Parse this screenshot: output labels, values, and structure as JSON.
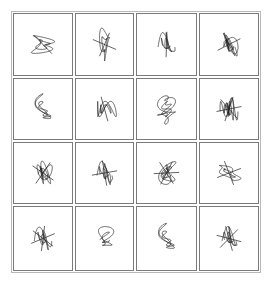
{
  "grid": {
    "rows": 4,
    "cols": 4
  },
  "colors": {
    "line": "#222222",
    "border": "#7a7a7a",
    "background": "#ffffff"
  },
  "figures": [
    {
      "id": "r1c1",
      "row": 1,
      "col": 1,
      "a": 1,
      "b": 2,
      "c": 3,
      "phase": 0.4,
      "orient": "left-shell",
      "spikes": 1
    },
    {
      "id": "r1c2",
      "row": 1,
      "col": 2,
      "a": 2,
      "b": 1,
      "c": 3,
      "phase": 0.0,
      "orient": "up-shell",
      "spikes": 2
    },
    {
      "id": "r1c3",
      "row": 1,
      "col": 3,
      "a": 1,
      "b": 2,
      "c": 4,
      "phase": 1.2,
      "orient": "diamond-wings",
      "spikes": 1
    },
    {
      "id": "r1c4",
      "row": 1,
      "col": 4,
      "a": 2,
      "b": 3,
      "c": 1,
      "phase": 0.7,
      "orient": "triangle-loop",
      "spikes": 2
    },
    {
      "id": "r2c1",
      "row": 2,
      "col": 1,
      "a": 2,
      "b": 1,
      "c": 2,
      "phase": 0.3,
      "orient": "butterfly",
      "spikes": 0
    },
    {
      "id": "r2c2",
      "row": 2,
      "col": 2,
      "a": 1,
      "b": 3,
      "c": 2,
      "phase": 0.9,
      "orient": "barrel",
      "spikes": 1
    },
    {
      "id": "r2c3",
      "row": 2,
      "col": 3,
      "a": 3,
      "b": 2,
      "c": 4,
      "phase": 0.5,
      "orient": "heart-loops",
      "spikes": 0
    },
    {
      "id": "r2c4",
      "row": 2,
      "col": 4,
      "a": 1,
      "b": 4,
      "c": 2,
      "phase": 1.5,
      "orient": "comb",
      "spikes": 3
    },
    {
      "id": "r3c1",
      "row": 3,
      "col": 1,
      "a": 2,
      "b": 3,
      "c": 2,
      "phase": 0.2,
      "orient": "face",
      "spikes": 2
    },
    {
      "id": "r3c2",
      "row": 3,
      "col": 2,
      "a": 1,
      "b": 2,
      "c": 5,
      "phase": 1.0,
      "orient": "eye",
      "spikes": 2
    },
    {
      "id": "r3c3",
      "row": 3,
      "col": 3,
      "a": 3,
      "b": 2,
      "c": 3,
      "phase": 0.6,
      "orient": "star-bug",
      "spikes": 3
    },
    {
      "id": "r3c4",
      "row": 3,
      "col": 4,
      "a": 2,
      "b": 1,
      "c": 4,
      "phase": 0.8,
      "orient": "beetle",
      "spikes": 2
    },
    {
      "id": "r4c1",
      "row": 4,
      "col": 1,
      "a": 1,
      "b": 2,
      "c": 3,
      "phase": 1.3,
      "orient": "cross-star",
      "spikes": 3
    },
    {
      "id": "r4c2",
      "row": 4,
      "col": 2,
      "a": 2,
      "b": 1,
      "c": 2,
      "phase": 0.1,
      "orient": "hood",
      "spikes": 0
    },
    {
      "id": "r4c3",
      "row": 4,
      "col": 3,
      "a": 2,
      "b": 3,
      "c": 2,
      "phase": 0.4,
      "orient": "ovals",
      "spikes": 0
    },
    {
      "id": "r4c4",
      "row": 4,
      "col": 4,
      "a": 1,
      "b": 2,
      "c": 4,
      "phase": 0.9,
      "orient": "squid",
      "spikes": 3
    }
  ]
}
